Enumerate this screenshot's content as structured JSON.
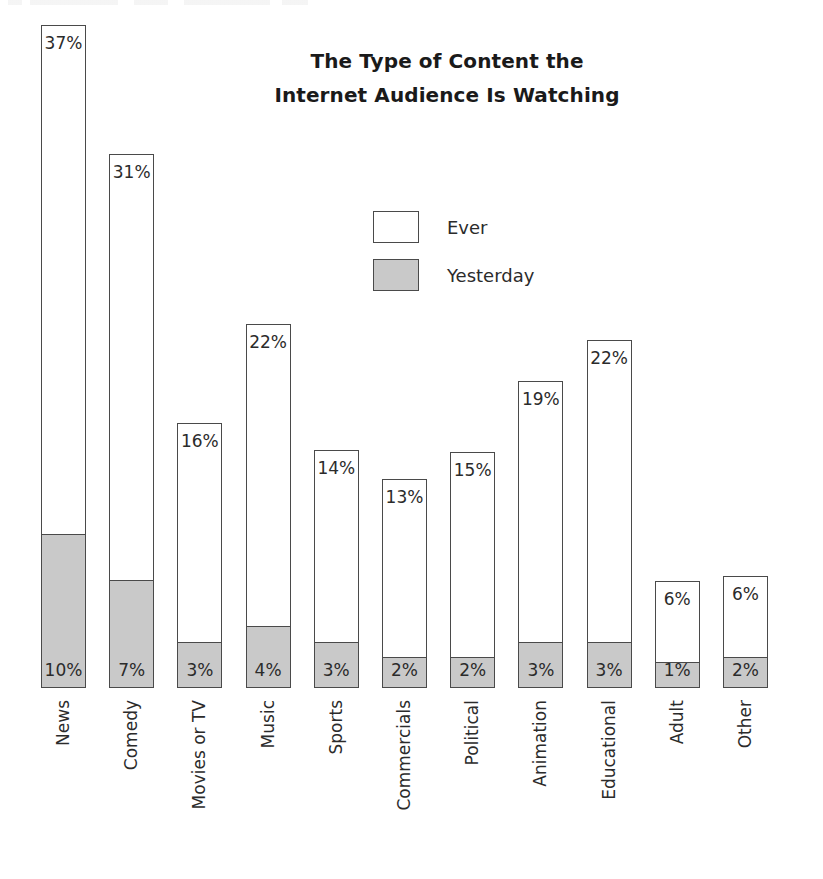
{
  "chart_data": {
    "type": "bar",
    "subtype": "stacked-vertical",
    "title": "The Type of Content the Internet Audience Is Watching",
    "title_lines": [
      "The Type of Content the",
      "Internet Audience Is Watching"
    ],
    "xlabel": "",
    "ylabel": "",
    "grid": false,
    "axis_visible": false,
    "legend_position": "center-top-inside",
    "categories": [
      "News",
      "Comedy",
      "Movies or TV",
      "Music",
      "Sports",
      "Commercials",
      "Political",
      "Animation",
      "Educational",
      "Adult",
      "Other"
    ],
    "series": [
      {
        "name": "Ever",
        "color": "#ffffff",
        "values": [
          37,
          31,
          16,
          22,
          14,
          13,
          15,
          19,
          22,
          6,
          6
        ],
        "labels": [
          "37%",
          "31%",
          "16%",
          "22%",
          "14%",
          "13%",
          "15%",
          "19%",
          "22%",
          "6%",
          "6%"
        ]
      },
      {
        "name": "Yesterday",
        "color": "#c9c9c9",
        "values": [
          10,
          7,
          3,
          4,
          3,
          2,
          2,
          3,
          3,
          1,
          2
        ],
        "labels": [
          "10%",
          "7%",
          "3%",
          "4%",
          "3%",
          "2%",
          "2%",
          "3%",
          "3%",
          "1%",
          "2%"
        ]
      }
    ],
    "units": "percent",
    "value_label_suffix": "%"
  },
  "legend": {
    "items": [
      {
        "label": "Ever",
        "swatch": "white-square"
      },
      {
        "label": "Yesterday",
        "swatch": "gray-square"
      }
    ]
  },
  "colors": {
    "ever_fill": "#ffffff",
    "yesterday_fill": "#c9c9c9",
    "outline": "#4a4a4a",
    "text": "#2b2b2b",
    "background": "#ffffff"
  }
}
